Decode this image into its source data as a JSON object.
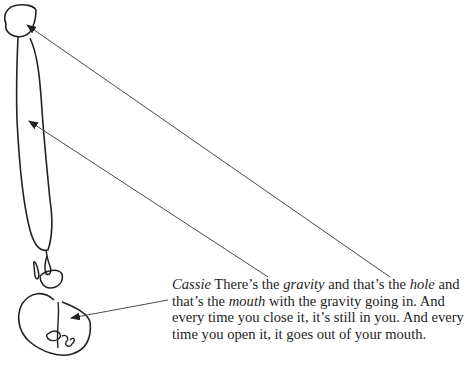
{
  "figure": {
    "labels": [
      "head",
      "gravity",
      "hole",
      "mouth"
    ],
    "arrows": [
      {
        "name": "head-arrow",
        "from": [
          390,
          277
        ],
        "to": [
          26,
          24
        ]
      },
      {
        "name": "gravity-arrow",
        "from": [
          268,
          277
        ],
        "to": [
          28,
          120
        ]
      },
      {
        "name": "mouth-arrow",
        "from": [
          168,
          300
        ],
        "to": [
          70,
          318
        ]
      }
    ]
  },
  "caption": {
    "speaker": "Cassie",
    "segments": [
      {
        "text": " There’s the ",
        "italic": false
      },
      {
        "text": "gravity",
        "italic": true
      },
      {
        "text": " and that’s the ",
        "italic": false
      },
      {
        "text": "hole",
        "italic": true
      },
      {
        "text": " and that’s the ",
        "italic": false
      },
      {
        "text": "mouth",
        "italic": true
      },
      {
        "text": " with the gravity going in. And every time you close it, it’s still in you. And every time you open it, it goes out of your mouth.",
        "italic": false
      }
    ]
  }
}
